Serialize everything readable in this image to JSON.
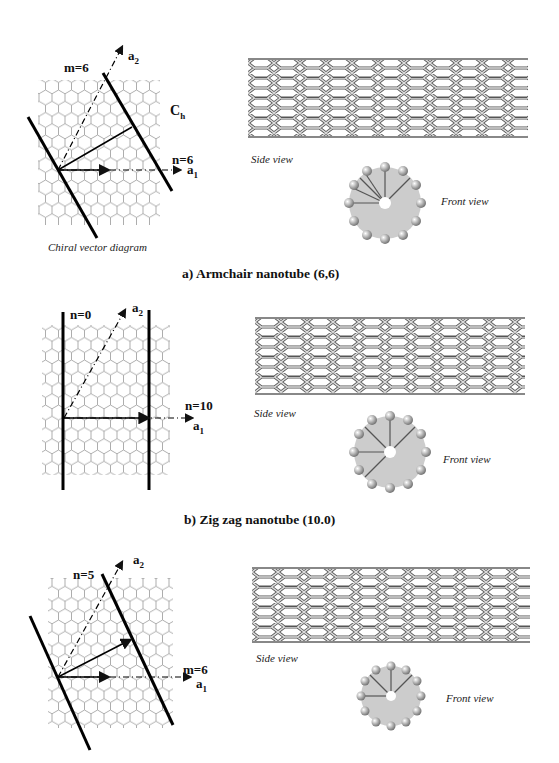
{
  "panels": [
    {
      "id": "a",
      "caption": "a) Armchair nanotube (6,6)",
      "diagram_title": "Chiral vector diagram",
      "labels": {
        "a2": "a",
        "a2_sub": "2",
        "a1": "a",
        "a1_sub": "1",
        "top_index": "m=6",
        "right_index": "n=6",
        "chiral": "C",
        "chiral_sub": "h"
      },
      "side_view": "Side view",
      "front_view": "Front view"
    },
    {
      "id": "b",
      "caption": "b) Zig zag nanotube (10.0)",
      "labels": {
        "a2": "a",
        "a2_sub": "2",
        "a1": "a",
        "a1_sub": "1",
        "top_index": "n=0",
        "right_index": "n=10"
      },
      "side_view": "Side view",
      "front_view": "Front view"
    },
    {
      "id": "c",
      "labels": {
        "a2": "a",
        "a2_sub": "2",
        "a1": "a",
        "a1_sub": "1",
        "top_index": "n=5",
        "right_index": "m=6"
      },
      "side_view": "Side view",
      "front_view": "Front view"
    }
  ]
}
